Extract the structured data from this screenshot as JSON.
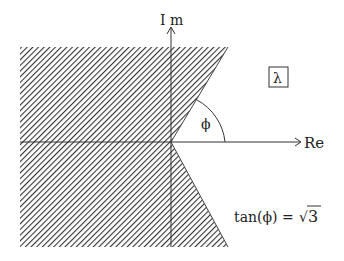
{
  "diagram": {
    "axes": {
      "imaginary_label": "I m",
      "real_label": "Re"
    },
    "plane_label": "λ",
    "angle_label": "ϕ",
    "equation": {
      "lhs": "tan(ϕ) = ",
      "sqrt_symbol": "√",
      "radicand": "3"
    },
    "colors": {
      "hatch": "#333333",
      "axis": "#333333",
      "background": "#ffffff"
    }
  }
}
